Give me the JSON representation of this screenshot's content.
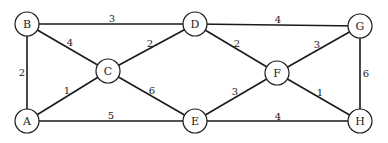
{
  "graph": {
    "nodes": [
      {
        "id": "A",
        "x": 27,
        "y": 121
      },
      {
        "id": "B",
        "x": 27,
        "y": 24
      },
      {
        "id": "C",
        "x": 108,
        "y": 71
      },
      {
        "id": "D",
        "x": 195,
        "y": 24
      },
      {
        "id": "E",
        "x": 195,
        "y": 121
      },
      {
        "id": "F",
        "x": 277,
        "y": 73
      },
      {
        "id": "G",
        "x": 360,
        "y": 26
      },
      {
        "id": "H",
        "x": 360,
        "y": 121
      }
    ],
    "edges": [
      {
        "from": "B",
        "to": "D",
        "weight": "3",
        "lx": 112,
        "ly": 18
      },
      {
        "from": "B",
        "to": "A",
        "weight": "2",
        "lx": 22,
        "ly": 72
      },
      {
        "from": "B",
        "to": "C",
        "weight": "4",
        "lx": 70,
        "ly": 42
      },
      {
        "from": "C",
        "to": "D",
        "weight": "2",
        "lx": 150,
        "ly": 43
      },
      {
        "from": "A",
        "to": "C",
        "weight": "1",
        "lx": 67,
        "ly": 90
      },
      {
        "from": "C",
        "to": "E",
        "weight": "6",
        "lx": 152,
        "ly": 90
      },
      {
        "from": "A",
        "to": "E",
        "weight": "5",
        "lx": 111,
        "ly": 115
      },
      {
        "from": "D",
        "to": "G",
        "weight": "4",
        "lx": 278,
        "ly": 19
      },
      {
        "from": "D",
        "to": "F",
        "weight": "2",
        "lx": 237,
        "ly": 43
      },
      {
        "from": "F",
        "to": "G",
        "weight": "3",
        "lx": 317,
        "ly": 44
      },
      {
        "from": "E",
        "to": "F",
        "weight": "3",
        "lx": 235,
        "ly": 91
      },
      {
        "from": "F",
        "to": "H",
        "weight": "1",
        "lx": 320,
        "ly": 92
      },
      {
        "from": "E",
        "to": "H",
        "weight": "4",
        "lx": 278,
        "ly": 116
      },
      {
        "from": "G",
        "to": "H",
        "weight": "6",
        "lx": 366,
        "ly": 73
      }
    ]
  }
}
